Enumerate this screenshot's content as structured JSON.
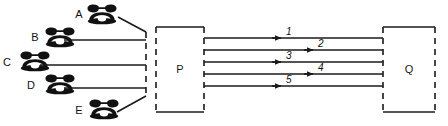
{
  "diagram": {
    "stroke_color": "#1a1a1a",
    "background_color": "#ffffff",
    "nodes": [
      {
        "id": "P",
        "label": "P",
        "x": 156,
        "y": 27,
        "w": 48,
        "h": 85
      },
      {
        "id": "Q",
        "label": "Q",
        "x": 383,
        "y": 27,
        "w": 52,
        "h": 85
      }
    ],
    "subscribers": [
      {
        "id": "A",
        "label": "A",
        "label_x": 79,
        "label_y": 18,
        "phone_x": 86,
        "phone_y": 4,
        "line_from_x": 118,
        "line_from_y": 17,
        "line_to_x": 146,
        "line_to_y": 32
      },
      {
        "id": "B",
        "label": "B",
        "label_x": 35,
        "label_y": 41,
        "phone_x": 44,
        "phone_y": 27,
        "line_from_x": 64,
        "line_from_y": 40,
        "line_to_x": 146,
        "line_to_y": 40
      },
      {
        "id": "C",
        "label": "C",
        "label_x": 7,
        "label_y": 66,
        "phone_x": 19,
        "phone_y": 51,
        "line_from_x": 40,
        "line_from_y": 65,
        "line_to_x": 146,
        "line_to_y": 65
      },
      {
        "id": "D",
        "label": "D",
        "label_x": 31,
        "label_y": 89,
        "phone_x": 44,
        "phone_y": 74,
        "line_from_x": 64,
        "line_from_y": 88,
        "line_to_x": 146,
        "line_to_y": 88
      },
      {
        "id": "E",
        "label": "E",
        "label_x": 79,
        "label_y": 114,
        "phone_x": 88,
        "phone_y": 99,
        "line_from_x": 117,
        "line_from_y": 112,
        "line_to_x": 146,
        "line_to_y": 96
      }
    ],
    "trunk_channels": [
      {
        "id": "1",
        "label": "1",
        "y": 38,
        "x1": 204,
        "x2": 383,
        "arrow_x": 280,
        "label_x": 286,
        "label_y": 35
      },
      {
        "id": "2",
        "label": "2",
        "y": 50,
        "x1": 204,
        "x2": 383,
        "arrow_x": 312,
        "label_x": 318,
        "label_y": 47
      },
      {
        "id": "3",
        "label": "3",
        "y": 62,
        "x1": 204,
        "x2": 383,
        "arrow_x": 280,
        "label_x": 286,
        "label_y": 59
      },
      {
        "id": "4",
        "label": "4",
        "y": 74,
        "x1": 204,
        "x2": 383,
        "arrow_x": 312,
        "label_x": 318,
        "label_y": 71
      },
      {
        "id": "5",
        "label": "5",
        "y": 86,
        "x1": 204,
        "x2": 383,
        "arrow_x": 280,
        "label_x": 286,
        "label_y": 83
      }
    ],
    "icons": {
      "phone": "telephone-icon"
    }
  }
}
